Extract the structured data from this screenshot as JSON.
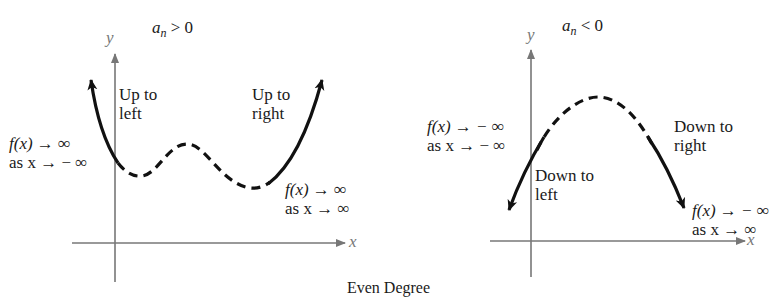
{
  "caption": "Even Degree",
  "colors": {
    "axis": "#777777",
    "curve": "#111111",
    "text": "#1a1a1a"
  },
  "left_panel": {
    "condition": {
      "a": "a",
      "sub": "n",
      "rel": " > 0"
    },
    "y_axis_label": "y",
    "x_axis_label": "x",
    "left_end_label": [
      "Up to",
      "left"
    ],
    "right_end_label": [
      "Up to",
      "right"
    ],
    "left_limit": [
      "f(x) → ∞",
      "as x → − ∞"
    ],
    "right_limit": [
      "f(x) → ∞",
      "as x → ∞"
    ]
  },
  "right_panel": {
    "condition": {
      "a": "a",
      "sub": "n",
      "rel": " < 0"
    },
    "y_axis_label": "y",
    "x_axis_label": "x",
    "left_end_label": [
      "Down to",
      "left"
    ],
    "right_end_label": [
      "Down to",
      "right"
    ],
    "left_limit": [
      "f(x) → − ∞",
      "as x → − ∞"
    ],
    "right_limit": [
      "f(x) → − ∞",
      "as x → ∞"
    ]
  }
}
